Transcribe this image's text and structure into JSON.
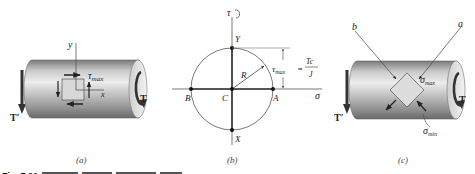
{
  "figure": {
    "panels": [
      {
        "id": "a",
        "caption": "(a)",
        "labels": {
          "y_axis": "y",
          "x_axis": "x",
          "shear": "τ",
          "shear_sub": "max",
          "torque_right": "T",
          "torque_left": "T′"
        }
      },
      {
        "id": "b",
        "caption": "(b)",
        "labels": {
          "tau_axis": "τ",
          "sigma_axis": "σ",
          "point_Y": "Y",
          "point_X": "X",
          "point_A": "A",
          "point_B": "B",
          "center_C": "C",
          "radius_R": "R",
          "tau_max": "τ",
          "tau_max_sub": "max",
          "equals": "=",
          "numerator": "Tc",
          "denominator": "J"
        }
      },
      {
        "id": "c",
        "caption": "(c)",
        "labels": {
          "line_a": "a",
          "line_b": "b",
          "sigma_max": "σ",
          "sigma_max_sub": "max",
          "sigma_min": "σ",
          "sigma_min_sub": "min",
          "torque_right": "T",
          "torque_left": "T′"
        }
      }
    ],
    "caption_partial": "Fig. 7.21"
  },
  "colors": {
    "cylinder_light": "#e4e4e4",
    "cylinder_mid": "#a9a9a9",
    "cylinder_dark": "#6e6e6e",
    "element_fill": "#d9d9d9",
    "line": "#333333",
    "arrow": "#222222"
  }
}
